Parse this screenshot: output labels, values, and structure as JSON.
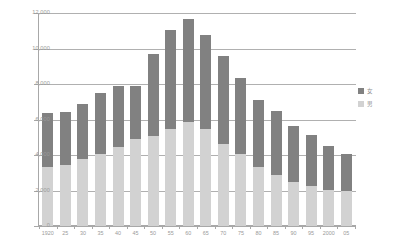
{
  "chart_data": {
    "type": "bar",
    "stacked": true,
    "title": "",
    "xlabel": "",
    "ylabel": "",
    "ylim": [
      0,
      12000
    ],
    "ytick_step": 2000,
    "ytick_labels": [
      "12,000",
      "10,000",
      "8,000",
      "6,000",
      "4,000",
      "2,000",
      "0"
    ],
    "ytick_values": [
      12000,
      10000,
      8000,
      6000,
      4000,
      2000,
      0
    ],
    "grid": true,
    "legend_position": "right",
    "categories": [
      "1920",
      "25",
      "30",
      "35",
      "40",
      "45",
      "50",
      "55",
      "60",
      "65",
      "70",
      "75",
      "80",
      "85",
      "90",
      "95",
      "2000",
      "05"
    ],
    "series": [
      {
        "name": "女",
        "color": "#818181",
        "values": [
          3000,
          2950,
          3150,
          3450,
          3450,
          3000,
          4600,
          5600,
          5800,
          5300,
          4950,
          4300,
          3800,
          3650,
          3150,
          2900,
          2450,
          2100
        ]
      },
      {
        "name": "男",
        "color": "#d2d2d2",
        "values": [
          3350,
          3450,
          3750,
          4050,
          4450,
          4900,
          5100,
          5450,
          5850,
          5450,
          4650,
          4050,
          3300,
          2850,
          2500,
          2250,
          2050,
          1950
        ]
      }
    ],
    "totals": [
      6350,
      6400,
      6900,
      7500,
      7900,
      7900,
      9700,
      11050,
      11650,
      10750,
      9600,
      8350,
      7100,
      6500,
      5650,
      5150,
      4500,
      4050
    ]
  },
  "legend": {
    "items": [
      {
        "label": "女",
        "color": "#818181"
      },
      {
        "label": "男",
        "color": "#d2d2d2"
      }
    ]
  }
}
